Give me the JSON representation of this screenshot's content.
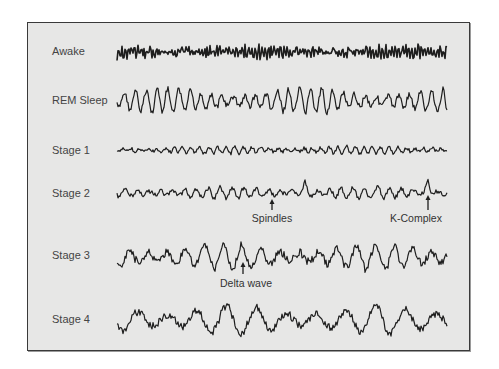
{
  "figure": {
    "title": "",
    "background_color": "#e7e7e6",
    "trace_color": "#1e1e1e",
    "rows": [
      {
        "label": "Awake",
        "y": 52,
        "amp": 5,
        "freq": 1.9,
        "noise": 0.9,
        "seed": 3
      },
      {
        "label": "REM Sleep",
        "y": 101,
        "amp": 11,
        "freq": 0.55,
        "noise": 0.35,
        "seed": 7
      },
      {
        "label": "Stage 1",
        "y": 150,
        "amp": 3.5,
        "freq": 0.7,
        "noise": 0.6,
        "seed": 11
      },
      {
        "label": "Stage 2",
        "y": 193,
        "amp": 5,
        "freq": 0.5,
        "noise": 0.55,
        "seed": 17
      },
      {
        "label": "Stage 3",
        "y": 257,
        "amp": 11,
        "freq": 0.32,
        "noise": 0.45,
        "seed": 23
      },
      {
        "label": "Stage 4",
        "y": 320,
        "amp": 13,
        "freq": 0.2,
        "noise": 0.35,
        "seed": 29
      }
    ],
    "trace_x_start": 117,
    "trace_x_end": 447,
    "annotations": [
      {
        "label": "Spindles",
        "arrow_x": 272,
        "arrow_y_top": 199,
        "arrow_y_bottom": 210,
        "label_x": 272,
        "label_y": 212
      },
      {
        "label": "K-Complex",
        "arrow_x": 428,
        "arrow_y_top": 195,
        "arrow_y_bottom": 210,
        "label_x": 416,
        "label_y": 212
      },
      {
        "label": "Delta wave",
        "arrow_x": 243,
        "arrow_y_top": 262,
        "arrow_y_bottom": 274,
        "label_x": 246,
        "label_y": 277
      }
    ]
  }
}
